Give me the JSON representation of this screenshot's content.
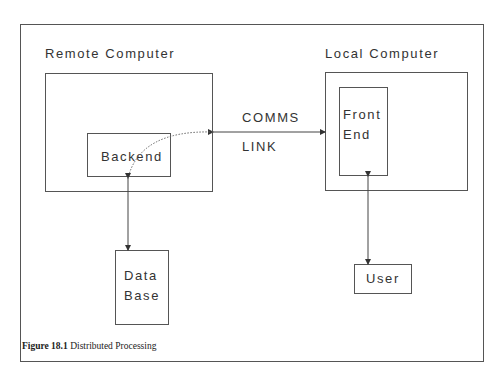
{
  "diagram": {
    "remote": {
      "title": "Remote Computer",
      "backend": "Backend",
      "database_line1": "Data",
      "database_line2": "Base"
    },
    "local": {
      "title": "Local Computer",
      "frontend_line1": "Front",
      "frontend_line2": "End",
      "user": "User"
    },
    "link": {
      "line1": "COMMS",
      "line2": "LINK"
    },
    "caption": {
      "number": "Figure 18.1",
      "text": "Distributed Processing"
    }
  }
}
